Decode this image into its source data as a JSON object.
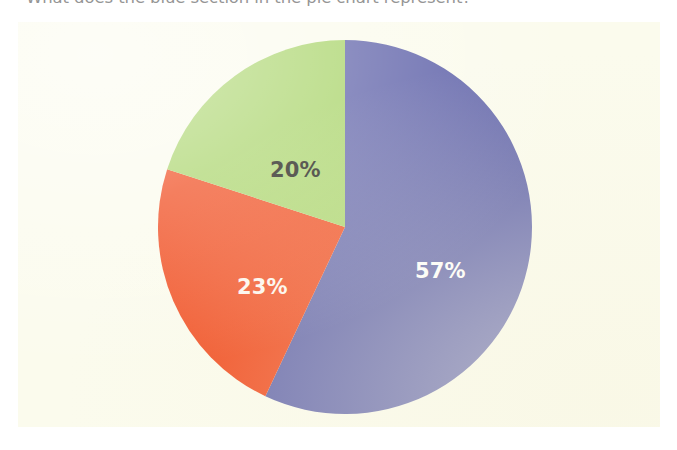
{
  "question": {
    "marker": "•",
    "text": "What does the blue section in the pie chart represent?"
  },
  "chart_data": {
    "type": "pie",
    "title": "",
    "subtitle": "",
    "xlabel": "",
    "ylabel": "",
    "grid": false,
    "legend": "none",
    "start_angle_deg": 0,
    "direction": "clockwise",
    "background_color": "#fbfbed",
    "categories": [
      "Blue",
      "Orange",
      "Green"
    ],
    "values": [
      57,
      23,
      20
    ],
    "value_unit": "%",
    "slices": [
      {
        "name": "blue-slice",
        "label": "57%",
        "value": 57,
        "color": "#6366ab",
        "label_color": "#ffffff"
      },
      {
        "name": "orange-slice",
        "label": "23%",
        "value": 23,
        "color": "#f04a1d",
        "label_color": "#fdf6ef"
      },
      {
        "name": "green-slice",
        "label": "20%",
        "value": 20,
        "color": "#a9d46a",
        "label_color": "#16160f"
      }
    ],
    "annotations": []
  }
}
